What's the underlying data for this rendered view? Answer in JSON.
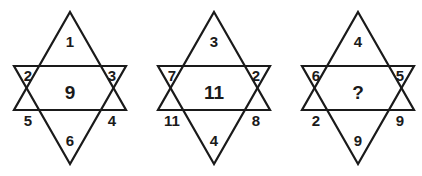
{
  "puzzle": {
    "type": "star-number-puzzle",
    "figure_count": 3,
    "line_color": "#1a1a1a",
    "fill_color": "#ffffff",
    "text_color": "#1a1a1a",
    "stars": [
      {
        "name": "star-1",
        "top": "1",
        "upper_left": "2",
        "upper_right": "3",
        "lower_left": "5",
        "lower_right": "4",
        "bottom": "6",
        "center": "9"
      },
      {
        "name": "star-2",
        "top": "3",
        "upper_left": "7",
        "upper_right": "2",
        "lower_left": "11",
        "lower_right": "8",
        "bottom": "4",
        "center": "11"
      },
      {
        "name": "star-3",
        "top": "4",
        "upper_left": "6",
        "upper_right": "5",
        "lower_left": "2",
        "lower_right": "9",
        "bottom": "9",
        "center": "?"
      }
    ]
  }
}
